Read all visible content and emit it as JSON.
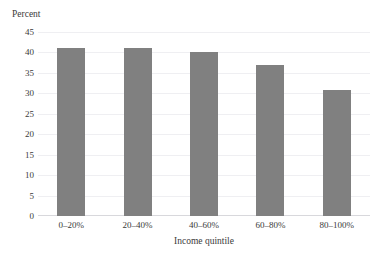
{
  "chart_data": {
    "type": "bar",
    "title": "",
    "categories": [
      "0–20%",
      "20–40%",
      "40–60%",
      "60–80%",
      "80–100%"
    ],
    "values": [
      41,
      41,
      40,
      37,
      30.7
    ],
    "xlabel": "Income quintile",
    "ylabel": "Percent",
    "ylim": [
      0,
      45
    ],
    "yticks": [
      0,
      5,
      10,
      15,
      20,
      25,
      30,
      35,
      40,
      45
    ],
    "ytick_labels": [
      "0",
      "5",
      "10",
      "15",
      "20",
      "25",
      "30",
      "35",
      "40",
      "45"
    ],
    "grid": true,
    "legend": false,
    "bar_color": "#808080",
    "background_color": "#ffffff",
    "gridline_color": "#efeff2",
    "axis_color": "#d8d8dc",
    "text_color": "#3a3a3a"
  }
}
